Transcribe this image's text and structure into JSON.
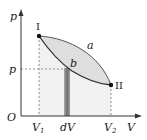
{
  "diagram": {
    "type": "p-V diagram",
    "axes": {
      "y_label": "p",
      "x_label": "V",
      "origin_label": "O"
    },
    "points": [
      {
        "label": "I",
        "x_label": "V1"
      },
      {
        "label": "II",
        "x_label": "V2"
      }
    ],
    "curves": [
      {
        "label": "a",
        "position": "upper"
      },
      {
        "label": "b",
        "position": "lower"
      }
    ],
    "annotations": {
      "pressure_label": "p",
      "strip_label": "dV",
      "v1_main": "V",
      "v1_sub": "1",
      "v2_main": "V",
      "v2_sub": "2"
    },
    "colors": {
      "enclosed_region": "#dcdcdc",
      "under_curve_region": "#f0f0f0",
      "strip": "#8a8a8a",
      "axes": "#333333"
    }
  }
}
